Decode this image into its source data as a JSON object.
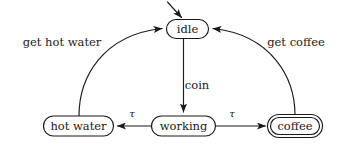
{
  "diagram": {
    "type": "state-machine",
    "title": "",
    "nodes": [
      {
        "id": "idle",
        "label": "idle",
        "shape": "stadium",
        "double_border": false,
        "initial": true,
        "x": 187.5,
        "y": 29,
        "rx": 21,
        "ry": 9.5
      },
      {
        "id": "hot_water",
        "label": "hot water",
        "shape": "stadium",
        "double_border": false,
        "initial": false,
        "x": 78.5,
        "y": 126,
        "rx": 35,
        "ry": 10
      },
      {
        "id": "working",
        "label": "working",
        "shape": "stadium",
        "double_border": false,
        "initial": false,
        "x": 183.5,
        "y": 126,
        "rx": 32,
        "ry": 10
      },
      {
        "id": "coffee",
        "label": "coffee",
        "shape": "stadium",
        "double_border": true,
        "initial": false,
        "x": 295,
        "y": 126,
        "rx": 25,
        "ry": 10
      }
    ],
    "edges": [
      {
        "id": "start-idle",
        "from": "",
        "to": "idle",
        "label": "",
        "kind": "initial-arrow"
      },
      {
        "id": "idle-working",
        "from": "idle",
        "to": "working",
        "label": "coin",
        "label_x": 197,
        "label_y": 86,
        "kind": "straight-down"
      },
      {
        "id": "working-hot-water",
        "from": "working",
        "to": "hot_water",
        "label": "τ",
        "label_x": 132,
        "label_y": 114,
        "kind": "straight-left"
      },
      {
        "id": "working-coffee",
        "from": "working",
        "to": "coffee",
        "label": "τ",
        "label_x": 232,
        "label_y": 114,
        "kind": "straight-right"
      },
      {
        "id": "hot-water-idle",
        "from": "hot_water",
        "to": "idle",
        "label": "get hot water",
        "label_x": 62,
        "label_y": 43,
        "kind": "curve-left"
      },
      {
        "id": "coffee-idle",
        "from": "coffee",
        "to": "idle",
        "label": "get coffee",
        "label_x": 296,
        "label_y": 43,
        "kind": "curve-right"
      }
    ]
  },
  "colors": {
    "background": "#ffffff",
    "stroke": "#1a1a1a",
    "text": "#1a1a1a"
  }
}
